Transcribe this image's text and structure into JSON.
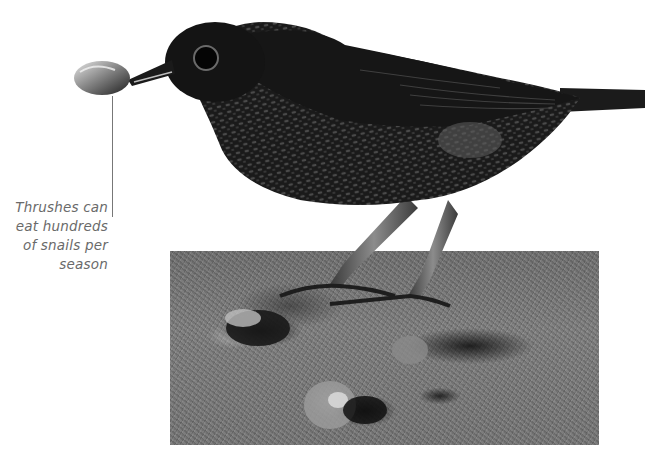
{
  "caption": {
    "line1": "Thrushes can",
    "line2": "eat hundreds",
    "line3": "of snails per",
    "line4": "season"
  },
  "illustration": {
    "subject": "thrush holding snail in beak",
    "background": "gravel ground photo with snail shells"
  },
  "colors": {
    "background": "#ffffff",
    "caption_text": "#6a6a6a",
    "leader_line": "#777777",
    "bird": "#141414",
    "ground": "#767676"
  }
}
